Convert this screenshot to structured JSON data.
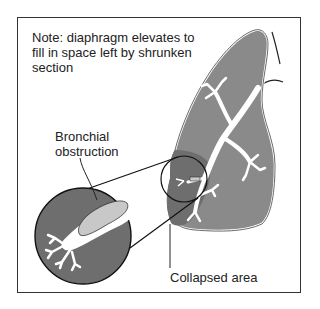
{
  "labels": {
    "note": "Note: diaphragm elevates to fill in space left by shrunken section",
    "bronchial_obstruction_line1": "Bronchial",
    "bronchial_obstruction_line2": "obstruction",
    "collapsed_area": "Collapsed area"
  },
  "colors": {
    "lung_fill": "#8a8a8a",
    "collapsed_fill": "#6e6e6e",
    "obstruction_fill": "#c8c8c8",
    "airway": "#ffffff",
    "outline": "#222222"
  }
}
